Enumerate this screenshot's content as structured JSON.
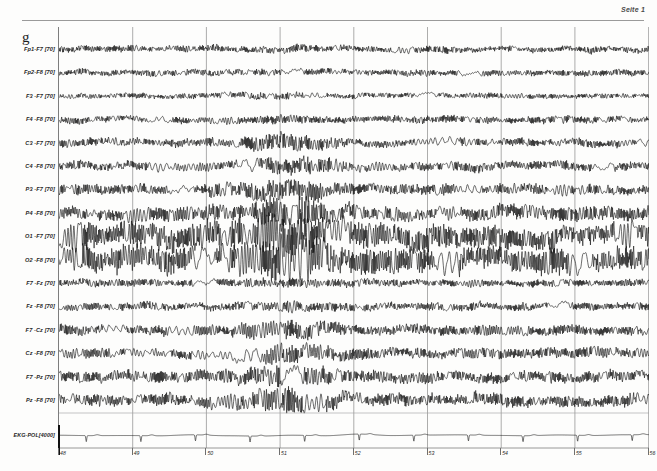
{
  "header": {
    "page_label": "Seite 1"
  },
  "montage": {
    "letter": "g"
  },
  "channels": [
    {
      "label": "Fp1-F7 [70]",
      "name": "fp1-f7"
    },
    {
      "label": "Fp2-F8 [70]",
      "name": "fp2-f8"
    },
    {
      "label": "F3 -F7 [70]",
      "name": "f3-f7"
    },
    {
      "label": "F4 -F8 [70]",
      "name": "f4-f8"
    },
    {
      "label": "C3 -F7 [70]",
      "name": "c3-f7"
    },
    {
      "label": "C4 -F8 [70]",
      "name": "c4-f8"
    },
    {
      "label": "P3 -F7 [70]",
      "name": "p3-f7"
    },
    {
      "label": "P4 -F8 [70]",
      "name": "p4-f8"
    },
    {
      "label": "O1 -F7 [70]",
      "name": "o1-f7"
    },
    {
      "label": "O2 -F8 [70]",
      "name": "o2-f8"
    },
    {
      "label": "F7 -Fz [70]",
      "name": "f7-fz"
    },
    {
      "label": "Fz -F8 [70]",
      "name": "fz-f8"
    },
    {
      "label": "F7 -Cz [70]",
      "name": "f7-cz"
    },
    {
      "label": "Cz -F8 [70]",
      "name": "cz-f8"
    },
    {
      "label": "F7 -Pz [70]",
      "name": "f7-pz"
    },
    {
      "label": "Pz -F8 [70]",
      "name": "pz-f8"
    }
  ],
  "ekg_channel": {
    "label": "EKG-POL[4000]",
    "name": "ekg-pol"
  },
  "time_axis": {
    "ticks": [
      "48",
      "49",
      "50",
      "51",
      "52",
      "53",
      "54",
      "55",
      "56"
    ],
    "unit_seconds_per_tick": 1
  },
  "colors": {
    "trace": "#141414",
    "gridline": "#8a8a8a",
    "border": "#7d7d7d",
    "background": "#fdfdfc",
    "text": "#1f1f1f"
  },
  "chart_data": {
    "type": "line",
    "xlabel": "Time (s)",
    "ylabel": "Channel",
    "xlim": [
      47.85,
      56.9
    ],
    "grid": true,
    "legend": "none",
    "x_tick_labels": [
      "48",
      "49",
      "50",
      "51",
      "52",
      "53",
      "54",
      "55",
      "56"
    ],
    "sampling_note": "traces rendered as continuous waveforms; amplitude in arbitrary display units",
    "series": [
      {
        "name": "Fp1-F7 [70]",
        "band": "mixed-beta",
        "amplitude": 3.0,
        "frequency_hz": 13,
        "row": 0
      },
      {
        "name": "Fp2-F8 [70]",
        "band": "mixed-beta",
        "amplitude": 2.8,
        "frequency_hz": 13,
        "row": 1
      },
      {
        "name": "F3 -F7 [70]",
        "band": "low-voltage",
        "amplitude": 2.4,
        "frequency_hz": 12,
        "row": 2
      },
      {
        "name": "F4 -F8 [70]",
        "band": "mixed",
        "amplitude": 3.2,
        "frequency_hz": 11,
        "row": 3
      },
      {
        "name": "C3 -F7 [70]",
        "band": "alpha-mixed",
        "amplitude": 3.6,
        "frequency_hz": 10,
        "row": 4
      },
      {
        "name": "C4 -F8 [70]",
        "band": "alpha-mixed",
        "amplitude": 4.2,
        "frequency_hz": 10,
        "row": 5
      },
      {
        "name": "P3 -F7 [70]",
        "band": "alpha",
        "amplitude": 5.0,
        "frequency_hz": 10,
        "row": 6
      },
      {
        "name": "P4 -F8 [70]",
        "band": "alpha",
        "amplitude": 6.5,
        "frequency_hz": 10,
        "row": 7
      },
      {
        "name": "O1 -F7 [70]",
        "band": "alpha-dominant",
        "amplitude": 11.0,
        "frequency_hz": 10,
        "row": 8
      },
      {
        "name": "O2 -F8 [70]",
        "band": "alpha-dominant",
        "amplitude": 11.5,
        "frequency_hz": 10,
        "row": 9
      },
      {
        "name": "F7 -Fz [70]",
        "band": "mixed",
        "amplitude": 3.4,
        "frequency_hz": 11,
        "row": 10
      },
      {
        "name": "Fz -F8 [70]",
        "band": "mixed",
        "amplitude": 3.6,
        "frequency_hz": 11,
        "row": 11
      },
      {
        "name": "F7 -Cz [70]",
        "band": "alpha-mixed",
        "amplitude": 4.6,
        "frequency_hz": 10,
        "row": 12
      },
      {
        "name": "Cz -F8 [70]",
        "band": "alpha-mixed",
        "amplitude": 4.6,
        "frequency_hz": 10,
        "row": 13
      },
      {
        "name": "F7 -Pz [70]",
        "band": "alpha-mixed",
        "amplitude": 5.2,
        "frequency_hz": 10,
        "row": 14
      },
      {
        "name": "Pz -F8 [70]",
        "band": "alpha-mixed",
        "amplitude": 5.6,
        "frequency_hz": 10,
        "row": 15
      },
      {
        "name": "EKG-POL[4000]",
        "band": "ecg",
        "amplitude": 6.0,
        "frequency_hz": 1.35,
        "row": 16
      }
    ],
    "burst_window_seconds": [
      50.6,
      51.6
    ],
    "burst_note": "high-amplitude posterior alpha burst with superimposed fast activity"
  }
}
